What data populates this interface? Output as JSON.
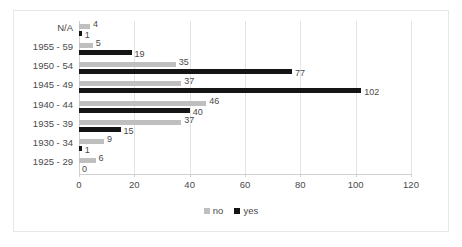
{
  "chart_data": {
    "type": "bar",
    "orientation": "horizontal",
    "title": "",
    "xlabel": "",
    "ylabel": "",
    "xlim": [
      0,
      120
    ],
    "xticks": [
      0,
      20,
      40,
      60,
      80,
      100,
      120
    ],
    "grid": true,
    "legend_position": "bottom",
    "categories": [
      "N/A",
      "1955 - 59",
      "1950 - 54",
      "1945 - 49",
      "1940 - 44",
      "1935 - 39",
      "1930 - 34",
      "1925 - 29"
    ],
    "series": [
      {
        "name": "no",
        "color": "#bfbfbf",
        "values": [
          4,
          5,
          35,
          37,
          46,
          37,
          9,
          6
        ]
      },
      {
        "name": "yes",
        "color": "#151515",
        "values": [
          1,
          19,
          77,
          102,
          40,
          15,
          1,
          0
        ]
      }
    ]
  },
  "legend": {
    "items": [
      {
        "label": "no",
        "color": "#bfbfbf"
      },
      {
        "label": "yes",
        "color": "#151515"
      }
    ]
  },
  "colors": {
    "no": "#bfbfbf",
    "yes": "#151515",
    "gridline": "#e3e3e3",
    "axis": "#d0d0d0",
    "text": "#4a4a4a",
    "frame": "#e8e8e8",
    "background": "#ffffff"
  }
}
